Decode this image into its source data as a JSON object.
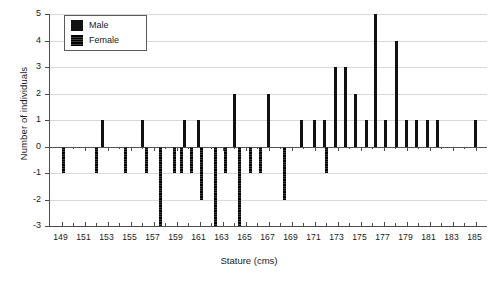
{
  "chart_data": {
    "type": "bar",
    "title": "",
    "xlabel": "Stature (cms)",
    "ylabel": "Number of individuals",
    "xlim": [
      148,
      186
    ],
    "ylim": [
      -3,
      5
    ],
    "yticks": [
      -3,
      -2,
      -1,
      0,
      1,
      2,
      3,
      4,
      5
    ],
    "xticks": [
      149,
      150,
      151,
      152,
      153,
      154,
      155,
      156,
      157,
      158,
      159,
      160,
      161,
      162,
      163,
      164,
      165,
      166,
      167,
      168,
      169,
      170,
      171,
      172,
      173,
      174,
      175,
      176,
      177,
      178,
      179,
      180,
      181,
      182,
      183,
      184,
      185
    ],
    "xtick_labels": [
      "149",
      "151",
      "153",
      "155",
      "157",
      "159",
      "161",
      "163",
      "165",
      "167",
      "169",
      "171",
      "173",
      "175",
      "177",
      "179",
      "181",
      "183",
      "185"
    ],
    "grid": "horizontal",
    "legend_position": "top-left",
    "orientation": "vertical-bidirectional",
    "series": [
      {
        "name": "Male",
        "color": "#111111",
        "direction": "positive",
        "points": [
          {
            "x": 152.6,
            "y": 1
          },
          {
            "x": 156.0,
            "y": 1
          },
          {
            "x": 159.7,
            "y": 1
          },
          {
            "x": 160.9,
            "y": 1
          },
          {
            "x": 164.0,
            "y": 2
          },
          {
            "x": 167.0,
            "y": 2
          },
          {
            "x": 169.9,
            "y": 1
          },
          {
            "x": 171.0,
            "y": 1
          },
          {
            "x": 171.9,
            "y": 1
          },
          {
            "x": 172.8,
            "y": 3
          },
          {
            "x": 173.7,
            "y": 3
          },
          {
            "x": 174.6,
            "y": 2
          },
          {
            "x": 175.5,
            "y": 1
          },
          {
            "x": 176.3,
            "y": 5
          },
          {
            "x": 177.2,
            "y": 1
          },
          {
            "x": 178.1,
            "y": 4
          },
          {
            "x": 179.0,
            "y": 1
          },
          {
            "x": 179.9,
            "y": 1
          },
          {
            "x": 180.8,
            "y": 1
          },
          {
            "x": 181.7,
            "y": 1
          },
          {
            "x": 185.0,
            "y": 1
          }
        ]
      },
      {
        "name": "Female",
        "color": "#111111",
        "direction": "negative",
        "points": [
          {
            "x": 149.2,
            "y": -1
          },
          {
            "x": 152.0,
            "y": -1
          },
          {
            "x": 154.6,
            "y": -1
          },
          {
            "x": 156.4,
            "y": -1
          },
          {
            "x": 157.6,
            "y": -3
          },
          {
            "x": 158.8,
            "y": -1
          },
          {
            "x": 159.4,
            "y": -1
          },
          {
            "x": 160.3,
            "y": -1
          },
          {
            "x": 161.2,
            "y": -2
          },
          {
            "x": 162.4,
            "y": -3
          },
          {
            "x": 163.3,
            "y": -1
          },
          {
            "x": 164.5,
            "y": -3
          },
          {
            "x": 165.4,
            "y": -1
          },
          {
            "x": 166.3,
            "y": -1
          },
          {
            "x": 168.4,
            "y": -2
          },
          {
            "x": 172.0,
            "y": -1
          }
        ]
      }
    ]
  },
  "legend": {
    "items": [
      {
        "label": "Male",
        "swatch": "male"
      },
      {
        "label": "Female",
        "swatch": "female"
      }
    ]
  }
}
